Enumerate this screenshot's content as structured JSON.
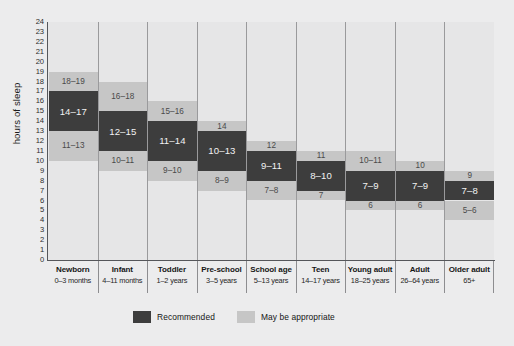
{
  "chart_data": {
    "type": "bar",
    "title": "",
    "xlabel": "",
    "ylabel": "hours of sleep",
    "ylim": [
      0,
      24
    ],
    "yticks": [
      24,
      23,
      22,
      21,
      20,
      19,
      18,
      17,
      16,
      15,
      14,
      13,
      12,
      11,
      10,
      9,
      8,
      7,
      6,
      5,
      4,
      3,
      2,
      1,
      0
    ],
    "grid": false,
    "legend_position": "bottom-center",
    "legend": [
      {
        "key": "recommended",
        "label": "Recommended",
        "color": "#3d3d3d"
      },
      {
        "key": "maybe",
        "label": "May be appropriate",
        "color": "#c6c6c6"
      }
    ],
    "categories": [
      {
        "name": "Newborn",
        "range": "0–3 months"
      },
      {
        "name": "Infant",
        "range": "4–11 months"
      },
      {
        "name": "Toddler",
        "range": "1–2 years"
      },
      {
        "name": "Pre-school",
        "range": "3–5 years"
      },
      {
        "name": "School age",
        "range": "5–13 years"
      },
      {
        "name": "Teen",
        "range": "14–17 years"
      },
      {
        "name": "Young adult",
        "range": "18–25 years"
      },
      {
        "name": "Adult",
        "range": "26–64 years"
      },
      {
        "name": "Older adult",
        "range": "65+"
      }
    ],
    "series": [
      {
        "name": "Newborn",
        "lower_maybe": {
          "from": 11,
          "to": 13,
          "label": "11–13"
        },
        "recommended": {
          "from": 14,
          "to": 17,
          "label": "14–17"
        },
        "upper_maybe": {
          "from": 18,
          "to": 19,
          "label": "18–19"
        }
      },
      {
        "name": "Infant",
        "lower_maybe": {
          "from": 10,
          "to": 11,
          "label": "10–11"
        },
        "recommended": {
          "from": 12,
          "to": 15,
          "label": "12–15"
        },
        "upper_maybe": {
          "from": 16,
          "to": 18,
          "label": "16–18"
        }
      },
      {
        "name": "Toddler",
        "lower_maybe": {
          "from": 9,
          "to": 10,
          "label": "9–10"
        },
        "recommended": {
          "from": 11,
          "to": 14,
          "label": "11–14"
        },
        "upper_maybe": {
          "from": 15,
          "to": 16,
          "label": "15–16"
        }
      },
      {
        "name": "Pre-school",
        "lower_maybe": {
          "from": 8,
          "to": 9,
          "label": "8–9"
        },
        "recommended": {
          "from": 10,
          "to": 13,
          "label": "10–13"
        },
        "upper_maybe": {
          "from": 14,
          "to": 14,
          "label": "14"
        }
      },
      {
        "name": "School age",
        "lower_maybe": {
          "from": 7,
          "to": 8,
          "label": "7–8"
        },
        "recommended": {
          "from": 9,
          "to": 11,
          "label": "9–11"
        },
        "upper_maybe": {
          "from": 12,
          "to": 12,
          "label": "12"
        }
      },
      {
        "name": "Teen",
        "lower_maybe": {
          "from": 7,
          "to": 7,
          "label": "7"
        },
        "recommended": {
          "from": 8,
          "to": 10,
          "label": "8–10"
        },
        "upper_maybe": {
          "from": 11,
          "to": 11,
          "label": "11"
        }
      },
      {
        "name": "Young adult",
        "lower_maybe": {
          "from": 6,
          "to": 6,
          "label": "6"
        },
        "recommended": {
          "from": 7,
          "to": 9,
          "label": "7–9"
        },
        "upper_maybe": {
          "from": 10,
          "to": 11,
          "label": "10–11"
        }
      },
      {
        "name": "Adult",
        "lower_maybe": {
          "from": 6,
          "to": 6,
          "label": "6"
        },
        "recommended": {
          "from": 7,
          "to": 9,
          "label": "7–9"
        },
        "upper_maybe": {
          "from": 10,
          "to": 10,
          "label": "10"
        }
      },
      {
        "name": "Older adult",
        "lower_maybe": {
          "from": 5,
          "to": 6,
          "label": "5–6"
        },
        "recommended": {
          "from": 7,
          "to": 8,
          "label": "7–8"
        },
        "upper_maybe": {
          "from": 9,
          "to": 9,
          "label": "9"
        }
      }
    ]
  }
}
